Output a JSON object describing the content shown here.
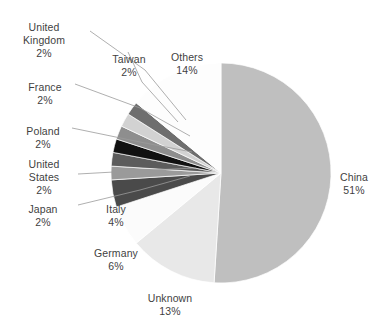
{
  "chart_data": {
    "type": "pie",
    "title": "",
    "subtitle": "",
    "xlabel": "",
    "ylabel": "",
    "legend_position": "none",
    "grid": false,
    "labels_show_percent": true,
    "start_angle_deg": 0,
    "direction": "clockwise",
    "categories": [
      "China",
      "Unknown",
      "Germany",
      "Italy",
      "Japan",
      "United States",
      "Poland",
      "France",
      "United Kingdom",
      "Taiwan",
      "Others"
    ],
    "values": [
      51,
      13,
      6,
      4,
      2,
      2,
      2,
      2,
      2,
      2,
      14
    ],
    "units": "percent",
    "slices": [
      {
        "label": "China",
        "value": 51,
        "pct_text": "51%",
        "color": "#bfbfbf"
      },
      {
        "label": "Unknown",
        "value": 13,
        "pct_text": "13%",
        "color": "#e8e8e8"
      },
      {
        "label": "Germany",
        "value": 6,
        "pct_text": "6%",
        "color": "#fbfbfb"
      },
      {
        "label": "Italy",
        "value": 4,
        "pct_text": "4%",
        "color": "#4a4a4a"
      },
      {
        "label": "Japan",
        "value": 2,
        "pct_text": "2%",
        "color": "#9a9a9a"
      },
      {
        "label": "United States",
        "value": 2,
        "pct_text": "2%",
        "color": "#5c5c5c"
      },
      {
        "label": "Poland",
        "value": 2,
        "pct_text": "2%",
        "color": "#111111"
      },
      {
        "label": "France",
        "value": 2,
        "pct_text": "2%",
        "color": "#8e8e8e"
      },
      {
        "label": "United Kingdom",
        "value": 2,
        "pct_text": "2%",
        "color": "#d2d2d2"
      },
      {
        "label": "Taiwan",
        "value": 2,
        "pct_text": "2%",
        "color": "#6e6e6e"
      },
      {
        "label": "Others",
        "value": 14,
        "pct_text": "14%",
        "color": "#fdfdfd"
      }
    ]
  },
  "labels": {
    "china": {
      "name": "China",
      "pct": "51%"
    },
    "unknown": {
      "name": "Unknown",
      "pct": "13%"
    },
    "germany": {
      "name": "Germany",
      "pct": "6%"
    },
    "italy": {
      "name": "Italy",
      "pct": "4%"
    },
    "japan": {
      "name": "Japan",
      "pct": "2%"
    },
    "united_states": {
      "name": "United\nStates",
      "pct": "2%"
    },
    "poland": {
      "name": "Poland",
      "pct": "2%"
    },
    "france": {
      "name": "France",
      "pct": "2%"
    },
    "united_kingdom": {
      "name": "United\nKingdom",
      "pct": "2%"
    },
    "taiwan": {
      "name": "Taiwan",
      "pct": "2%"
    },
    "others": {
      "name": "Others",
      "pct": "14%"
    }
  },
  "style": {
    "background": "#ffffff",
    "text_color": "#3f3f3f",
    "leader_line_color": "#9b9b9b",
    "slice_outline": "#ffffff"
  }
}
